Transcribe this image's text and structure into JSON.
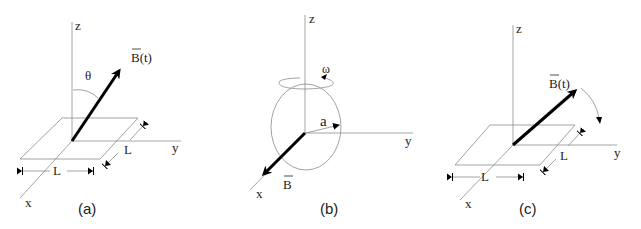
{
  "panels": [
    {
      "id": "a",
      "caption": "(a)",
      "axes": {
        "x": "x",
        "y": "y",
        "z": "z"
      },
      "vector_label": "B(t)",
      "angle_label": "θ",
      "side_label_front": "L",
      "side_label_right": "L",
      "shape": "square loop in xy-plane"
    },
    {
      "id": "b",
      "caption": "(b)",
      "axes": {
        "x": "x",
        "y": "y",
        "z": "z"
      },
      "vector_label": "B",
      "radius_label": "a",
      "rotation_label": "ω",
      "shape": "circular loop rotating about z-axis"
    },
    {
      "id": "c",
      "caption": "(c)",
      "axes": {
        "x": "x",
        "y": "y",
        "z": "z"
      },
      "vector_label": "B(t)",
      "side_label_front": "L",
      "side_label_right": "L",
      "shape": "square loop in xy-plane, rotating field"
    }
  ]
}
